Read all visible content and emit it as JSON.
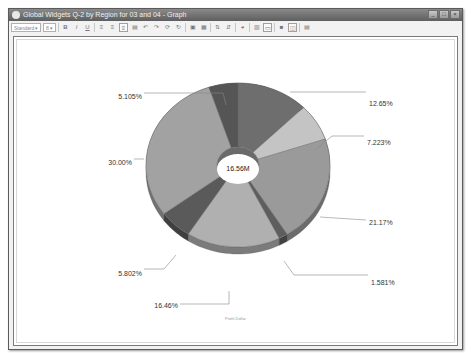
{
  "window": {
    "title": "Global Widgets Q-2 by Region for 03 and 04 - Graph",
    "buttons": [
      "minimize",
      "maximize",
      "close"
    ]
  },
  "toolbar": {
    "font_select": "Standard",
    "size_select": "8",
    "buttons": [
      "bold",
      "italic",
      "underline",
      "align-left",
      "align-center",
      "align-right",
      "insert",
      "undo",
      "redo",
      "rotate",
      "chart-type",
      "chart-options",
      "sort-asc",
      "sort-desc",
      "pie-options",
      "grid",
      "legend",
      "color",
      "properties",
      "export"
    ]
  },
  "chart_data": {
    "type": "pie",
    "subtype": "donut-3d",
    "center_label": "16.56M",
    "caption": "Profit Dollar",
    "slices": [
      {
        "label": "12.65%",
        "value": 12.65,
        "color": "#6e6e6e"
      },
      {
        "label": "7.223%",
        "value": 7.223,
        "color": "#c4c4c4"
      },
      {
        "label": "21.17%",
        "value": 21.17,
        "color": "#9a9a9a"
      },
      {
        "label": "1.581%",
        "value": 1.581,
        "color": "#5e5e5e"
      },
      {
        "label": "16.46%",
        "value": 16.46,
        "color": "#b0b0b0"
      },
      {
        "label": "5.802%",
        "value": 5.802,
        "color": "#5a5a5a"
      },
      {
        "label": "30.00%",
        "value": 30.0,
        "color": "#a2a2a2"
      },
      {
        "label": "5.105%",
        "value": 5.105,
        "color": "#555555"
      }
    ]
  }
}
